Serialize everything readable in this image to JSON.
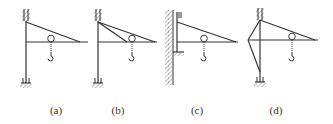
{
  "figure": {
    "panels": [
      {
        "id": "a",
        "label": "(a)",
        "label_x": 56,
        "description": "Mast fixed top and bottom, single diagonal tie, horizontal boom with pulley and hook"
      },
      {
        "id": "b",
        "label": "(b)",
        "label_x": 118,
        "description": "Mast fixed top and bottom, two diagonal ties, horizontal boom with pulley and hook, wall on right"
      },
      {
        "id": "c",
        "label": "(c)",
        "label_x": 197,
        "description": "Short mast attached to wall on left, diagonal tie, horizontal boom with pulley and hook"
      },
      {
        "id": "d",
        "label": "(d)",
        "label_x": 276,
        "description": "Mast fixed top and bottom with side bracing strut, diagonal tie, boom with pulley and hook"
      }
    ],
    "colors": {
      "line": "#333333",
      "hatch": "#555555"
    }
  }
}
